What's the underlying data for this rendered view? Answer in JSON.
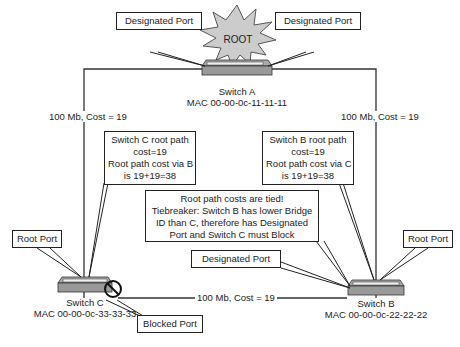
{
  "diagram": {
    "root_label": "ROOT",
    "switches": [
      {
        "id": "A",
        "name": "Switch A",
        "mac": "MAC 00-00-0c-11-11-11"
      },
      {
        "id": "B",
        "name": "Switch B",
        "mac": "MAC 00-00-0c-22-22-22"
      },
      {
        "id": "C",
        "name": "Switch C",
        "mac": "MAC 00-00-0c-33-33-33"
      }
    ],
    "links": [
      {
        "from": "A",
        "to": "C",
        "label": "100 Mb, Cost = 19"
      },
      {
        "from": "A",
        "to": "B",
        "label": "100 Mb, Cost = 19"
      },
      {
        "from": "C",
        "to": "B",
        "label": "100 Mb, Cost = 19"
      }
    ],
    "callouts": {
      "a_designated_left": "Designated Port",
      "a_designated_right": "Designated Port",
      "c_root_path": [
        "Switch C root path",
        "cost=19",
        "Root path cost via B",
        "is 19+19=38"
      ],
      "b_root_path": [
        "Switch B root path",
        "cost=19",
        "Root path cost via C",
        "is 19+19=38"
      ],
      "tiebreaker": [
        "Root path costs are tied!",
        "Tiebreaker:  Switch B has lower Bridge",
        "ID than C, therefore has Designated",
        "Port and Switch C must Block"
      ],
      "b_designated": "Designated Port",
      "c_root_port": "Root Port",
      "b_root_port": "Root Port",
      "c_blocked_port": "Blocked Port"
    }
  }
}
